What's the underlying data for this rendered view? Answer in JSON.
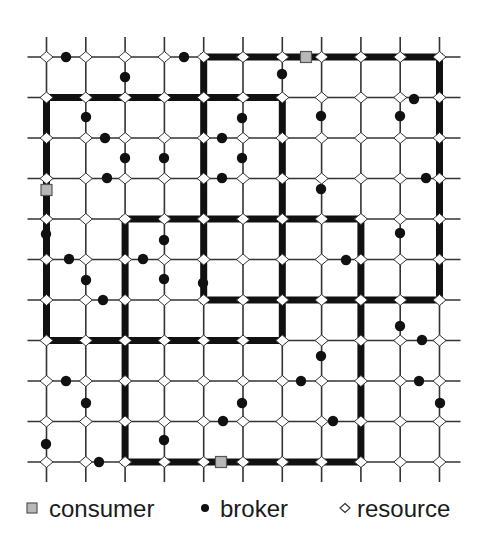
{
  "figure": {
    "type": "grid-overlay-network-diagram",
    "grid": {
      "columns_x": [
        46.5,
        85.8,
        125.1,
        164.4,
        203.7,
        243.0,
        282.3,
        321.6,
        360.9,
        400.2,
        439.5
      ],
      "rows_y": [
        57,
        97.5,
        138,
        178.5,
        219,
        259.5,
        300,
        340.5,
        381,
        421.5,
        462
      ],
      "line_color": "#333333",
      "overhang_left": 19,
      "overhang_right": 21,
      "overhang_top": 20,
      "overhang_bottom": 20
    },
    "regions": [
      {
        "name": "region-a",
        "c0": 0,
        "c1": 6,
        "r0": 1,
        "r1": 7
      },
      {
        "name": "region-b",
        "c0": 4,
        "c1": 10,
        "r0": 0,
        "r1": 6
      },
      {
        "name": "region-c",
        "c0": 2,
        "c1": 8,
        "r0": 4,
        "r1": 10
      }
    ],
    "region_border_color": "#111111",
    "consumers": [
      {
        "x": 306,
        "y": 57
      },
      {
        "x": 46.5,
        "y": 190
      },
      {
        "x": 221,
        "y": 462
      }
    ],
    "brokers": [
      {
        "x": 66,
        "y": 57
      },
      {
        "x": 125,
        "y": 77
      },
      {
        "x": 184,
        "y": 57
      },
      {
        "x": 282,
        "y": 74
      },
      {
        "x": 414,
        "y": 99
      },
      {
        "x": 400,
        "y": 116
      },
      {
        "x": 86,
        "y": 117
      },
      {
        "x": 242,
        "y": 118
      },
      {
        "x": 321,
        "y": 116
      },
      {
        "x": 105,
        "y": 138
      },
      {
        "x": 222,
        "y": 138
      },
      {
        "x": 125,
        "y": 158
      },
      {
        "x": 164,
        "y": 158
      },
      {
        "x": 242,
        "y": 158
      },
      {
        "x": 107,
        "y": 178
      },
      {
        "x": 222,
        "y": 178
      },
      {
        "x": 426,
        "y": 178
      },
      {
        "x": 321,
        "y": 189
      },
      {
        "x": 164,
        "y": 240
      },
      {
        "x": 400,
        "y": 233
      },
      {
        "x": 46,
        "y": 234
      },
      {
        "x": 69,
        "y": 259
      },
      {
        "x": 143,
        "y": 259
      },
      {
        "x": 346,
        "y": 260
      },
      {
        "x": 86,
        "y": 280
      },
      {
        "x": 164,
        "y": 279
      },
      {
        "x": 203,
        "y": 283
      },
      {
        "x": 103,
        "y": 300
      },
      {
        "x": 400,
        "y": 326
      },
      {
        "x": 422,
        "y": 340
      },
      {
        "x": 321,
        "y": 356
      },
      {
        "x": 66,
        "y": 381
      },
      {
        "x": 301,
        "y": 381
      },
      {
        "x": 419,
        "y": 381
      },
      {
        "x": 86,
        "y": 403
      },
      {
        "x": 242,
        "y": 403
      },
      {
        "x": 440,
        "y": 403
      },
      {
        "x": 223,
        "y": 421
      },
      {
        "x": 333,
        "y": 421
      },
      {
        "x": 164,
        "y": 440
      },
      {
        "x": 46,
        "y": 444
      },
      {
        "x": 99,
        "y": 462
      }
    ],
    "colors": {
      "consumer_fill": "#b8b8b8",
      "consumer_stroke": "#555555",
      "broker_fill": "#111111",
      "resource_fill": "#ffffff",
      "resource_stroke": "#333333"
    }
  },
  "legend": {
    "items": [
      {
        "label": "consumer",
        "symbol": "consumer-square"
      },
      {
        "label": "broker",
        "symbol": "broker-dot"
      },
      {
        "label": "resource",
        "symbol": "resource-diamond"
      }
    ]
  }
}
